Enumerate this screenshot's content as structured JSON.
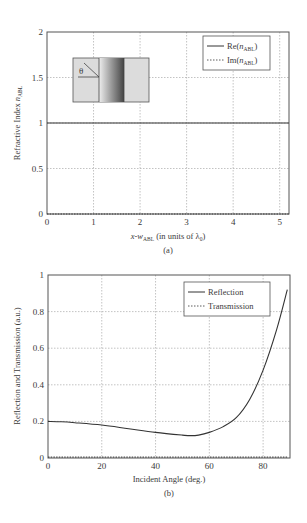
{
  "chart_data": [
    {
      "panel": "(a)",
      "type": "line",
      "title": "",
      "xlabel": "x-w_ABL (in units of λ0)",
      "xlabel_parts": {
        "main": "x-w",
        "sub": "ABL",
        "rest": " (in units of λ",
        "sub2": "0",
        "end": ")"
      },
      "ylabel": "Refractive Index n_ABL",
      "ylabel_parts": {
        "main": "Refractive Index ",
        "italic": "n",
        "sub": "ABL"
      },
      "xlim": [
        0,
        5.2
      ],
      "ylim": [
        0,
        2
      ],
      "xticks": [
        0,
        1,
        2,
        3,
        4,
        5
      ],
      "yticks": [
        0,
        0.5,
        1,
        1.5,
        2
      ],
      "ytick_labels": [
        "0",
        "0.5",
        "1",
        "1.5",
        "2"
      ],
      "grid": true,
      "legend_position": "upper right",
      "series": [
        {
          "name": "Re(n_ABL)",
          "label_main": "Re(",
          "label_italic": "n",
          "label_sub": "ABL",
          "label_end": ")",
          "style": "solid",
          "x": [
            0,
            1,
            2,
            3,
            4,
            5,
            5.2
          ],
          "values": [
            1,
            1,
            1,
            1,
            1,
            1,
            1
          ]
        },
        {
          "name": "Im(n_ABL)",
          "label_main": "Im(",
          "label_italic": "n",
          "label_sub": "ABL",
          "label_end": ")",
          "style": "dotted",
          "x": [
            0,
            1,
            2,
            3,
            4,
            5,
            5.2
          ],
          "values": [
            0,
            0,
            0,
            0,
            0,
            0,
            0
          ]
        }
      ],
      "inset": {
        "angle_label": "θ",
        "description": "slab with graded absorbing layer, incident angle θ"
      }
    },
    {
      "panel": "(b)",
      "type": "line",
      "title": "",
      "xlabel": "Incident Angle (deg.)",
      "ylabel": "Reflection and Transmission (a.u.)",
      "xlim": [
        0,
        90
      ],
      "ylim": [
        0,
        1
      ],
      "xticks": [
        0,
        20,
        40,
        60,
        80
      ],
      "yticks": [
        0,
        0.2,
        0.4,
        0.6,
        0.8,
        1
      ],
      "ytick_labels": [
        "0",
        "0.2",
        "0.4",
        "0.6",
        "0.8",
        "1"
      ],
      "grid": true,
      "legend_position": "upper right",
      "series": [
        {
          "name": "Reflection",
          "style": "solid",
          "x": [
            0,
            5,
            10,
            20,
            30,
            40,
            50,
            53,
            56,
            60,
            65,
            70,
            75,
            80,
            85,
            89
          ],
          "values": [
            0.2,
            0.198,
            0.193,
            0.18,
            0.16,
            0.14,
            0.125,
            0.122,
            0.125,
            0.14,
            0.17,
            0.22,
            0.32,
            0.48,
            0.7,
            0.92
          ]
        },
        {
          "name": "Transmission",
          "style": "dotted",
          "x": [
            0,
            20,
            40,
            60,
            80,
            89
          ],
          "values": [
            0.005,
            0.005,
            0.005,
            0.005,
            0.005,
            0.005
          ]
        }
      ]
    }
  ],
  "captions": {
    "a": "(a)",
    "b": "(b)"
  },
  "colors": {
    "axis": "#555555",
    "grid": "#9a9a9a",
    "line": "#333333",
    "inset_fill": "#d9d9d9",
    "inset_dark": "#555555"
  }
}
